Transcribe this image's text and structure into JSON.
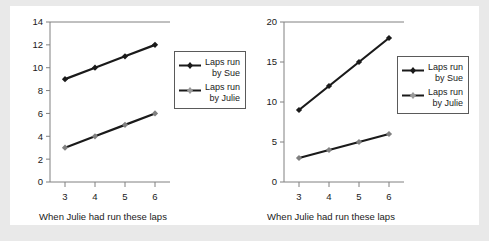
{
  "figure": {
    "background_color": "#e9e9e9",
    "panel_color": "#ffffff"
  },
  "colors": {
    "sue_series": "#1a1a1a",
    "julie_series": "#808080",
    "axis": "#808080",
    "text": "#1a1a1a",
    "legend_border": "#5a5a5a"
  },
  "legend": {
    "sue_line1": "Laps run",
    "sue_line2": "by Sue",
    "julie_line1": "Laps run",
    "julie_line2": "by Julie",
    "sue_marker_icon": "diamond-marker-black",
    "julie_marker_icon": "diamond-marker-gray"
  },
  "chart_data": [
    {
      "type": "line",
      "title": "",
      "xlabel": "When Julie had run these laps",
      "ylabel": "",
      "x": [
        3,
        4,
        5,
        6
      ],
      "xticklabels": [
        "3",
        "4",
        "5",
        "6"
      ],
      "yticks": [
        0,
        2,
        4,
        6,
        8,
        10,
        12,
        14
      ],
      "yticklabels": [
        "0",
        "2",
        "4",
        "6",
        "8",
        "10",
        "12",
        "14"
      ],
      "ylim": [
        0,
        14
      ],
      "xlim": [
        2.5,
        6.5
      ],
      "grid": false,
      "legend_position": "right",
      "series": [
        {
          "name": "Laps run by Sue",
          "values": [
            9,
            10,
            11,
            12
          ],
          "color": "#1a1a1a",
          "marker": "diamond"
        },
        {
          "name": "Laps run by Julie",
          "values": [
            3,
            4,
            5,
            6
          ],
          "color": "#808080",
          "marker": "diamond"
        }
      ]
    },
    {
      "type": "line",
      "title": "",
      "xlabel": "When Julie had run these laps",
      "ylabel": "",
      "x": [
        3,
        4,
        5,
        6
      ],
      "xticklabels": [
        "3",
        "4",
        "5",
        "6"
      ],
      "yticks": [
        0,
        5,
        10,
        15,
        20
      ],
      "yticklabels": [
        "0",
        "5",
        "10",
        "15",
        "20"
      ],
      "ylim": [
        0,
        20
      ],
      "xlim": [
        2.5,
        6.5
      ],
      "grid": false,
      "legend_position": "right",
      "series": [
        {
          "name": "Laps run by Sue",
          "values": [
            9,
            12,
            15,
            18
          ],
          "color": "#1a1a1a",
          "marker": "diamond"
        },
        {
          "name": "Laps run by Julie",
          "values": [
            3,
            4,
            5,
            6
          ],
          "color": "#808080",
          "marker": "diamond"
        }
      ]
    }
  ]
}
